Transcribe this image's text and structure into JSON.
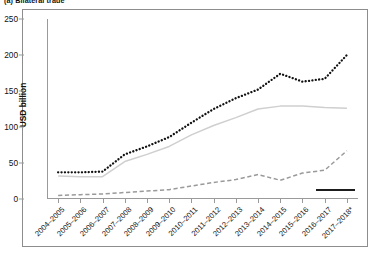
{
  "caption": "(a) Bilateral trade",
  "axes": {
    "ylabel": "USD billion",
    "yticks": [
      "0",
      "50",
      "100",
      "150",
      "200",
      "250"
    ]
  },
  "legend_key": "solid-black-key",
  "chart_data": {
    "type": "line",
    "title": "",
    "subtitle": "",
    "xlabel": "",
    "ylabel": "USD billion",
    "ylim": [
      0,
      250
    ],
    "ytick_values": [
      0,
      50,
      100,
      150,
      200,
      250
    ],
    "grid": false,
    "legend_position": "none",
    "categories": [
      "2004–2005",
      "2005–2006",
      "2006–2007",
      "2007–2008",
      "2008–2009",
      "2009–2010",
      "2010–2011",
      "2011–2012",
      "2012–2013",
      "2013–2014",
      "2014–2015",
      "2015–2016",
      "2016–2017",
      "2017–2018*"
    ],
    "series": [
      {
        "name": "total-trade",
        "style": "dotted",
        "color": "#111111",
        "values": [
          37,
          37,
          38,
          62,
          73,
          86,
          106,
          125,
          140,
          152,
          174,
          163,
          167,
          200
        ]
      },
      {
        "name": "imports",
        "style": "solid",
        "color": "#cfcfcf",
        "values": [
          32,
          31,
          31,
          52,
          62,
          73,
          89,
          102,
          113,
          125,
          129,
          129,
          127,
          126
        ]
      },
      {
        "name": "exports",
        "style": "dashed",
        "color": "#9a9a9a",
        "values": [
          5,
          6,
          7,
          9,
          11,
          13,
          18,
          23,
          27,
          34,
          26,
          36,
          40,
          67
        ]
      }
    ]
  }
}
